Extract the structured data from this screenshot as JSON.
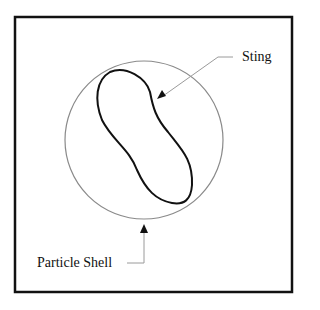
{
  "diagram": {
    "labels": {
      "sting": "Sting",
      "particle_shell": "Particle Shell"
    },
    "colors": {
      "frame": "#111111",
      "shell": "#8a8a8a",
      "sting": "#111111",
      "arrow": "#111111",
      "leader": "#9a9a9a"
    }
  }
}
